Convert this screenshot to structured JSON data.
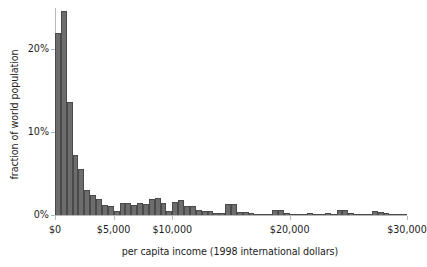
{
  "chart_data": {
    "type": "bar",
    "title": "",
    "xlabel": "per capita income (1998 international dollars)",
    "ylabel": "fraction of world population",
    "xlim": [
      0,
      30000
    ],
    "ylim": [
      0,
      25
    ],
    "grid": false,
    "legend": null,
    "bin_width": 500,
    "value_unit": "percent",
    "xtick_labels": [
      "$0",
      "$5,000",
      "$10,000",
      "$20,000",
      "$30,000"
    ],
    "xtick_values": [
      0,
      5000,
      10000,
      20000,
      30000
    ],
    "ytick_labels": [
      "0%",
      "10%",
      "20%"
    ],
    "ytick_values": [
      0,
      10,
      20
    ],
    "x": [
      250,
      750,
      1250,
      1750,
      2250,
      2750,
      3250,
      3750,
      4250,
      4750,
      5250,
      5750,
      6250,
      6750,
      7250,
      7750,
      8250,
      8750,
      9250,
      9750,
      10250,
      10750,
      11250,
      11750,
      12250,
      12750,
      13250,
      13750,
      14250,
      14750,
      15250,
      15750,
      16250,
      16750,
      17250,
      17750,
      18250,
      18750,
      19250,
      19750,
      20250,
      20750,
      21250,
      21750,
      22250,
      22750,
      23250,
      23750,
      24250,
      24750,
      25250,
      25750,
      26250,
      26750,
      27250,
      27750,
      28250,
      28750,
      29250,
      29750
    ],
    "values": [
      22.0,
      24.6,
      13.6,
      7.2,
      5.6,
      3.0,
      2.4,
      1.9,
      1.2,
      1.1,
      0.5,
      1.4,
      1.5,
      1.2,
      1.4,
      1.3,
      1.9,
      2.0,
      1.5,
      0.5,
      1.6,
      1.8,
      1.1,
      1.1,
      0.6,
      0.5,
      0.5,
      0.3,
      0.2,
      1.3,
      1.3,
      0.4,
      0.4,
      0.3,
      0.1,
      0.1,
      0.1,
      0.6,
      0.6,
      0.2,
      0.1,
      0.1,
      0.05,
      0.3,
      0.05,
      0.05,
      0.3,
      0.05,
      0.6,
      0.6,
      0.3,
      0.1,
      0.05,
      0.05,
      0.5,
      0.4,
      0.2,
      0.1,
      0.05,
      0.05
    ]
  },
  "colors": {
    "bar_fill": "#6d6d6d",
    "bar_edge": "#4a4a4a",
    "axis": "#b9b9b9",
    "text": "#1d1d1d",
    "background": "#ffffff"
  }
}
